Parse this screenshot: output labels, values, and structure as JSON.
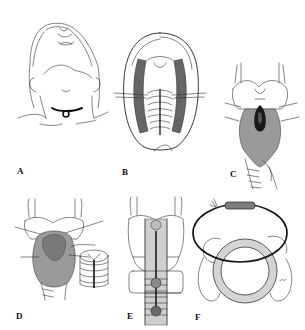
{
  "figure": {
    "panels": [
      {
        "id": "A",
        "label": "A",
        "content": "patient head extended, collar incision at base of neck"
      },
      {
        "id": "B",
        "label": "B",
        "content": "exposed trachea with strap muscles retracted, vertical midline incision"
      },
      {
        "id": "C",
        "label": "C",
        "content": "larynx and trachea anterior view with shaded thyroid isthmus and dark opening"
      },
      {
        "id": "D",
        "label": "D",
        "content": "larynx with shaded tissue over trachea; inset ring with sutures"
      },
      {
        "id": "E",
        "label": "E",
        "content": "larynx and trachea with vertical line and circular markers, stippled trachea"
      },
      {
        "id": "F",
        "label": "F",
        "content": "cross-section of stippled tracheal ring encircled by dark loop with tube segment"
      }
    ]
  },
  "colors": {
    "background": "#ffffff",
    "line": "#333333",
    "shading": "#9a9a9a",
    "dark": "#111111"
  }
}
